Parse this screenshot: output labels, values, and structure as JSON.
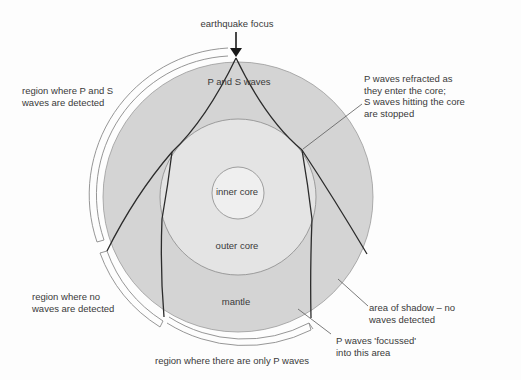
{
  "diagram": {
    "focus_label": "earthquake focus",
    "layers": {
      "inner_core": "inner core",
      "outer_core": "outer core",
      "mantle": "mantle",
      "crust_region": "P and S waves"
    },
    "annotations": {
      "ps_detected": [
        "region where P and S",
        "waves are detected"
      ],
      "refracted": [
        "P waves refracted as",
        "they enter the core;",
        "S waves hitting the core",
        "are stopped"
      ],
      "no_waves": [
        "region where no",
        "waves are detected"
      ],
      "shadow": [
        "area of shadow – no",
        "waves detected"
      ],
      "focussed": [
        "P waves 'focussed'",
        "into this area"
      ],
      "only_p": "region where there are only P waves"
    },
    "colors": {
      "mantle": "#d4d4d4",
      "outer_core": "#e4e4e4",
      "inner_core": "#efefef",
      "ray": "#2b2b2b",
      "outline": "#7a7a7a",
      "text": "#3a3a3a"
    }
  }
}
